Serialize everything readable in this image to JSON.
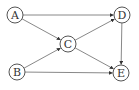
{
  "diagram": {
    "type": "directed-graph",
    "nodes": [
      {
        "id": "A",
        "label": "A",
        "x": 15,
        "y": 15
      },
      {
        "id": "B",
        "label": "B",
        "x": 17,
        "y": 72
      },
      {
        "id": "C",
        "label": "C",
        "x": 68,
        "y": 44
      },
      {
        "id": "D",
        "label": "D",
        "x": 122,
        "y": 15
      },
      {
        "id": "E",
        "label": "E",
        "x": 121,
        "y": 73
      }
    ],
    "edges": [
      {
        "from": "A",
        "to": "D"
      },
      {
        "from": "A",
        "to": "C"
      },
      {
        "from": "B",
        "to": "C"
      },
      {
        "from": "B",
        "to": "E"
      },
      {
        "from": "C",
        "to": "D"
      },
      {
        "from": "C",
        "to": "E"
      },
      {
        "from": "D",
        "to": "E"
      }
    ],
    "node_radius": 8,
    "colors": {
      "node_stroke": "#555555",
      "edge": "#6a6a6a",
      "label": "#333333",
      "background": "#ffffff"
    }
  }
}
